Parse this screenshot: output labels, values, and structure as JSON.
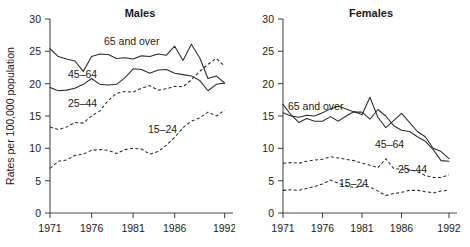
{
  "figure": {
    "y_axis_title": "Rates per 100,000 population"
  },
  "chart_data": [
    {
      "type": "line",
      "title": "Males",
      "xlabel": "",
      "ylabel": "Rates per 100,000 population",
      "xlim": [
        1971,
        1992
      ],
      "ylim": [
        0,
        30
      ],
      "yticks": [
        0,
        5,
        10,
        15,
        20,
        25,
        30
      ],
      "xticks": [
        1971,
        1976,
        1981,
        1986,
        1992
      ],
      "grid": false,
      "legend": "inline-annotations",
      "x": [
        1971,
        1972,
        1973,
        1974,
        1975,
        1976,
        1977,
        1978,
        1979,
        1980,
        1981,
        1982,
        1983,
        1984,
        1985,
        1986,
        1987,
        1988,
        1989,
        1990,
        1991,
        1992
      ],
      "series": [
        {
          "name": "65 and over",
          "style": "solid",
          "label_text": "65 and over",
          "values": [
            25.4,
            24.2,
            23.8,
            23.5,
            21.9,
            24.2,
            24.6,
            24.5,
            23.9,
            24.0,
            23.8,
            24.3,
            24.2,
            24.6,
            24.4,
            25.8,
            23.6,
            26.1,
            24.0,
            20.8,
            21.2,
            20.1
          ]
        },
        {
          "name": "45-64",
          "style": "solid",
          "label_text": "45–64",
          "values": [
            19.4,
            18.9,
            19.0,
            19.3,
            19.9,
            20.8,
            19.9,
            19.8,
            19.9,
            20.9,
            22.3,
            22.2,
            21.6,
            22.1,
            22.2,
            21.6,
            21.4,
            21.2,
            20.5,
            18.9,
            19.9,
            20.1
          ]
        },
        {
          "name": "25-44",
          "style": "dashed",
          "label_text": "25–44",
          "values": [
            13.3,
            12.9,
            13.3,
            14.0,
            13.9,
            15.0,
            15.8,
            17.4,
            18.5,
            18.8,
            18.7,
            19.3,
            19.7,
            19.0,
            19.2,
            19.6,
            19.5,
            20.6,
            21.9,
            23.0,
            23.9,
            22.7
          ]
        },
        {
          "name": "15-24",
          "style": "dashed",
          "label_text": "15–24",
          "values": [
            6.9,
            8.0,
            8.2,
            8.9,
            9.1,
            9.7,
            9.8,
            9.7,
            9.2,
            9.8,
            10.0,
            9.9,
            9.1,
            9.5,
            10.5,
            11.7,
            13.2,
            14.2,
            14.7,
            15.6,
            15.0,
            15.9
          ]
        }
      ]
    },
    {
      "type": "line",
      "title": "Females",
      "xlabel": "",
      "ylabel": "",
      "xlim": [
        1971,
        1992
      ],
      "ylim": [
        0,
        30
      ],
      "yticks": [
        0,
        5,
        10,
        15,
        20,
        25,
        30
      ],
      "xticks": [
        1971,
        1976,
        1981,
        1986,
        1992
      ],
      "grid": false,
      "legend": "inline-annotations",
      "x": [
        1971,
        1972,
        1973,
        1974,
        1975,
        1976,
        1977,
        1978,
        1979,
        1980,
        1981,
        1982,
        1983,
        1984,
        1985,
        1986,
        1987,
        1988,
        1989,
        1990,
        1991,
        1992
      ],
      "series": [
        {
          "name": "65 and over",
          "style": "solid",
          "label_text": "65 and over",
          "values": [
            16.8,
            15.2,
            14.0,
            14.6,
            14.2,
            14.2,
            14.9,
            14.2,
            15.0,
            15.7,
            15.2,
            17.9,
            14.8,
            13.2,
            14.3,
            15.4,
            14.0,
            12.6,
            11.8,
            10.0,
            9.5,
            8.4
          ]
        },
        {
          "name": "45-64",
          "style": "solid",
          "label_text": "45–64",
          "values": [
            15.5,
            15.0,
            14.8,
            15.1,
            15.0,
            15.5,
            16.1,
            16.5,
            16.1,
            15.6,
            15.6,
            14.5,
            16.0,
            15.0,
            13.5,
            12.8,
            12.6,
            11.8,
            11.1,
            9.8,
            8.1,
            8.0
          ]
        },
        {
          "name": "25-44",
          "style": "dashed",
          "label_text": "25–44",
          "values": [
            7.7,
            7.8,
            7.7,
            8.0,
            8.2,
            8.3,
            8.7,
            8.5,
            8.3,
            8.1,
            7.7,
            7.4,
            7.0,
            8.4,
            6.9,
            6.7,
            6.7,
            6.4,
            5.8,
            5.5,
            5.5,
            5.9
          ]
        },
        {
          "name": "15-24",
          "style": "dashed",
          "label_text": "15–24",
          "values": [
            3.5,
            3.6,
            3.5,
            3.8,
            4.1,
            4.5,
            5.1,
            4.6,
            4.2,
            3.9,
            4.2,
            4.0,
            3.4,
            2.7,
            3.0,
            3.2,
            3.5,
            3.5,
            3.3,
            3.1,
            3.4,
            3.5
          ]
        }
      ]
    }
  ]
}
